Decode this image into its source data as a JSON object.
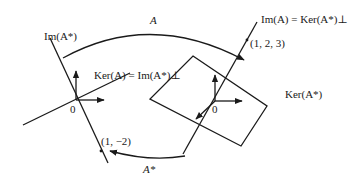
{
  "figure": {
    "left_space": {
      "image_line_label": "Im(A*)",
      "kernel_line_label": "Ker(A) = Im(A*)⊥",
      "origin_label": "0",
      "point_label": "(1, −2)"
    },
    "right_space": {
      "image_line_label": "Im(A) = Ker(A*)⊥",
      "point_label": "(1, 2, 3)",
      "plane_label": "Ker(A*)",
      "origin_label": "0"
    },
    "maps": {
      "forward_label": "A",
      "adjoint_label": "A*"
    }
  }
}
